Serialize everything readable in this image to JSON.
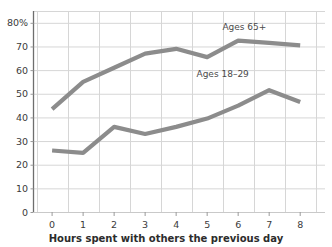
{
  "chart_data": {
    "type": "line",
    "title": "",
    "subtitle": "",
    "xlabel": "Hours spent with others the previous day",
    "ylabel": "",
    "x": [
      0,
      1,
      2,
      3,
      4,
      5,
      6,
      7,
      8
    ],
    "xtick_labels": [
      "0",
      "1",
      "2",
      "3",
      "4",
      "5",
      "6",
      "7",
      "8"
    ],
    "ytick_labels": [
      "0",
      "10",
      "20",
      "30",
      "40",
      "50",
      "60",
      "70",
      "80%"
    ],
    "yticks": [
      0,
      10,
      20,
      30,
      40,
      50,
      60,
      70,
      80
    ],
    "ylim": [
      0,
      85
    ],
    "xlim": [
      -0.6,
      8.8
    ],
    "grid": true,
    "legend_position": "inline-annotations",
    "series": [
      {
        "name": "Ages 65+",
        "color": "#8c8c8c",
        "values": [
          43.5,
          55,
          61,
          67,
          69,
          65.5,
          72.5,
          71.5,
          70.5
        ],
        "annotation": "Ages 65+",
        "annotation_x": 6.2,
        "annotation_y": 77
      },
      {
        "name": "Ages 18–29",
        "color": "#8c8c8c",
        "values": [
          26,
          25,
          36,
          33,
          36,
          39.5,
          45,
          51.5,
          46.5
        ],
        "annotation": "Ages 18–29",
        "annotation_x": 5.5,
        "annotation_y": 57
      }
    ]
  },
  "axis": {
    "x_title": "Hours spent with others the previous day",
    "y_ticks": [
      {
        "label": "80%",
        "value": 80
      },
      {
        "label": "70",
        "value": 70
      },
      {
        "label": "60",
        "value": 60
      },
      {
        "label": "50",
        "value": 50
      },
      {
        "label": "40",
        "value": 40
      },
      {
        "label": "30",
        "value": 30
      },
      {
        "label": "20",
        "value": 20
      },
      {
        "label": "10",
        "value": 10
      },
      {
        "label": "0",
        "value": 0
      }
    ],
    "x_ticks": [
      {
        "label": "0",
        "value": 0
      },
      {
        "label": "1",
        "value": 1
      },
      {
        "label": "2",
        "value": 2
      },
      {
        "label": "3",
        "value": 3
      },
      {
        "label": "4",
        "value": 4
      },
      {
        "label": "5",
        "value": 5
      },
      {
        "label": "6",
        "value": 6
      },
      {
        "label": "7",
        "value": 7
      },
      {
        "label": "8",
        "value": 8
      }
    ]
  },
  "colors": {
    "line": "#8c8c8c",
    "grid": "#d6d6d6",
    "axis": "#6e6e6e",
    "text": "#3b3b3b",
    "background": "#ffffff"
  }
}
